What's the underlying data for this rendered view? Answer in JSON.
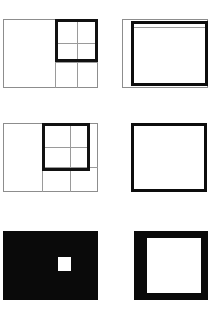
{
  "panel": {
    "title": "six-figure geometric panel",
    "background_color": "#ffffff",
    "width": 215,
    "height": 310,
    "rows": 3,
    "columns": 2
  },
  "colors": {
    "background": "#ffffff",
    "ink_black": "#0a0a0a",
    "bold_stroke": "#111111",
    "thin_stroke": "#8d8d8d",
    "guide_line": "#9a9a9a",
    "fill_white": "#ffffff"
  },
  "figures": [
    {
      "id": "fig-top-left",
      "position": "top-left",
      "description": "thin outlined rectangle subdivided by light guide lines with a bold square overlaid on the upper right region containing a light cross",
      "outer": {
        "x": 3,
        "y": 19,
        "w": 95,
        "h": 69,
        "stroke": "thin"
      },
      "guides": {
        "verticals": [
          55,
          77
        ],
        "horizontals": [
          62
        ]
      },
      "bold_square": {
        "x": 55,
        "y": 19,
        "w": 43,
        "h": 43,
        "stroke": "bold"
      },
      "inner_cross": {
        "vertical_at": 77,
        "horizontal_at": 43
      }
    },
    {
      "id": "fig-top-right",
      "position": "top-right",
      "description": "thin outlined rectangle with a thick bold square inset toward the right side",
      "outer": {
        "x": 122,
        "y": 19,
        "w": 86,
        "h": 69,
        "stroke": "thin"
      },
      "bold_square": {
        "x": 131,
        "y": 21,
        "w": 76,
        "h": 65,
        "stroke": "bold"
      },
      "inner_guide": {
        "horizontal_at": 27
      }
    },
    {
      "id": "fig-middle-left",
      "position": "middle-left",
      "description": "thin outlined rectangle subdivided by light guide lines with a bold square overlaid on the upper right region containing a light cross",
      "outer": {
        "x": 3,
        "y": 123,
        "w": 95,
        "h": 69,
        "stroke": "thin"
      },
      "guides": {
        "verticals": [
          42,
          70
        ],
        "horizontals": [
          167
        ]
      },
      "bold_square": {
        "x": 42,
        "y": 123,
        "w": 48,
        "h": 48,
        "stroke": "bold"
      },
      "inner_cross": {
        "vertical_at": 70,
        "horizontal_at": 147
      }
    },
    {
      "id": "fig-middle-right",
      "position": "middle-right",
      "description": "plain thick outlined square with empty white interior",
      "bold_square": {
        "x": 131,
        "y": 123,
        "w": 76,
        "h": 69,
        "stroke": "bold"
      }
    },
    {
      "id": "fig-bottom-left",
      "position": "bottom-left",
      "description": "solid black rectangle containing one small white square set right of center",
      "black_block": {
        "x": 3,
        "y": 231,
        "w": 95,
        "h": 69
      },
      "white_square": {
        "x": 58,
        "y": 257,
        "w": 13,
        "h": 14
      }
    },
    {
      "id": "fig-bottom-right",
      "position": "bottom-right",
      "description": "solid black rectangle containing one large white square leaving a thick black frame",
      "black_block": {
        "x": 134,
        "y": 231,
        "w": 74,
        "h": 69
      },
      "white_square": {
        "x": 147,
        "y": 238,
        "w": 54,
        "h": 55
      }
    }
  ]
}
